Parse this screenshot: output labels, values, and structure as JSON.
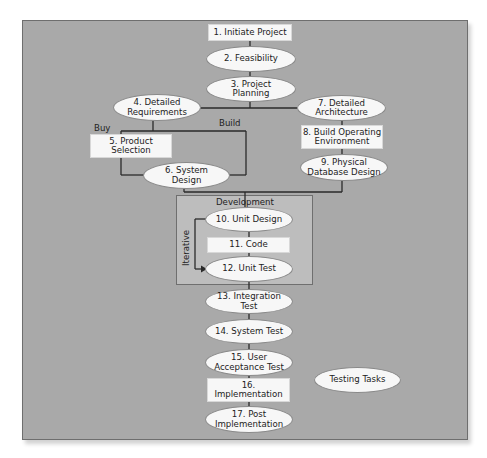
{
  "diagram": {
    "title": "",
    "nodes": {
      "n1": {
        "label": "1. Initiate Project",
        "shape": "rectangle"
      },
      "n2": {
        "label": "2. Feasibility",
        "shape": "ellipse"
      },
      "n3": {
        "label": "3. Project\nPlanning",
        "shape": "ellipse"
      },
      "n4": {
        "label": "4. Detailed\nRequirements",
        "shape": "ellipse"
      },
      "n5": {
        "label": "5. Product\nSelection",
        "shape": "rectangle"
      },
      "n6": {
        "label": "6. System\nDesign",
        "shape": "ellipse"
      },
      "n7": {
        "label": "7. Detailed\nArchitecture",
        "shape": "ellipse"
      },
      "n8": {
        "label": "8. Build Operating\nEnvironment",
        "shape": "rectangle"
      },
      "n9": {
        "label": "9. Physical\nDatabase Design",
        "shape": "ellipse"
      },
      "n10": {
        "label": "10. Unit Design",
        "shape": "ellipse"
      },
      "n11": {
        "label": "11. Code",
        "shape": "rectangle"
      },
      "n12": {
        "label": "12. Unit Test",
        "shape": "ellipse"
      },
      "n13": {
        "label": "13. Integration\nTest",
        "shape": "ellipse"
      },
      "n14": {
        "label": "14. System Test",
        "shape": "ellipse"
      },
      "n15": {
        "label": "15. User\nAcceptance Test",
        "shape": "ellipse"
      },
      "n16": {
        "label": "16.\nImplementation",
        "shape": "rectangle"
      },
      "n17": {
        "label": "17. Post\nImplementation",
        "shape": "ellipse"
      }
    },
    "legend": {
      "testing_tasks": {
        "label": "Testing Tasks",
        "shape": "ellipse"
      }
    },
    "group": {
      "development": {
        "label": "Development"
      },
      "iterative": {
        "label": "Iterative"
      }
    },
    "branch_labels": {
      "buy": "Buy",
      "build": "Build"
    },
    "colors": {
      "panel_background": "#a9a9a9",
      "development_background": "#bdbdbd",
      "node_fill": "#f7f7f7",
      "line": "#2a2a2a"
    }
  }
}
